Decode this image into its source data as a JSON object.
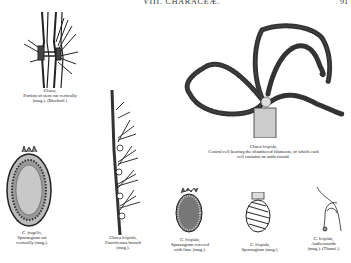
{
  "header": {
    "running_title": "VIII. CHARACEÆ.",
    "page_number": "91"
  },
  "figures": [
    {
      "id": "fig-stem-section",
      "species": "Chara,",
      "lines": [
        "Portion of stem cut vertically",
        "(mag.).   (Bischoff.)"
      ]
    },
    {
      "id": "fig-central-cell",
      "species": "Chara hispida,",
      "lines": [
        "Central cell bearing the chambered filaments, of which each",
        "cell contains an antherozoid."
      ]
    },
    {
      "id": "fig-fragilis-sporangium",
      "species": "C. fragilis,",
      "lines": [
        "Sporangium cut",
        "vertically (mag.)."
      ]
    },
    {
      "id": "fig-fructiferous-branch",
      "species": "Chara hispida,",
      "lines": [
        "Fructiferous branch",
        "(mag.)."
      ]
    },
    {
      "id": "fig-sporangium-lime",
      "species": "C. hispida,",
      "lines": [
        "Sporangium covered",
        "with lime (mag.)."
      ]
    },
    {
      "id": "fig-sporangium",
      "species": "C. hispida,",
      "lines": [
        "Sporangium (mag.)."
      ]
    },
    {
      "id": "fig-antherozoids",
      "species": "C. hispida,",
      "lines": [
        "Antherozoids",
        "(mag.).   (Thomé.)"
      ]
    }
  ]
}
